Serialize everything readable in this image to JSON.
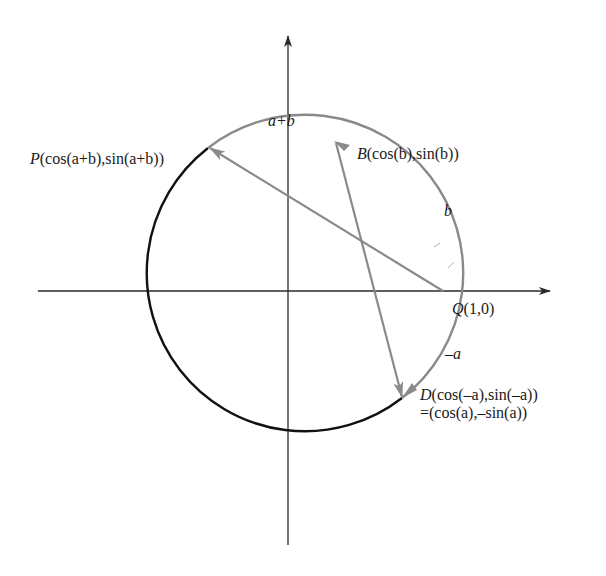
{
  "diagram": {
    "type": "unit-circle-angle-sum",
    "labels": {
      "P_name": "P",
      "P_coords": "(cos(a+b),sin(a+b))",
      "B_name": "B",
      "B_coords": "(cos(b),sin(b))",
      "Q_name": "Q",
      "Q_coords": "(1,0)",
      "D_name": "D",
      "D_coords": "(cos(–a),sin(–a))",
      "D_equiv": "=(cos(a),–sin(a))",
      "arc_a_plus_b": "a+b",
      "arc_b": "b",
      "arc_neg_a": "–a"
    },
    "colors": {
      "axis": "#2a2a2a",
      "gray_arc": "#8a8a8a",
      "black_arc": "#111111",
      "chord": "#8a8a8a"
    }
  }
}
